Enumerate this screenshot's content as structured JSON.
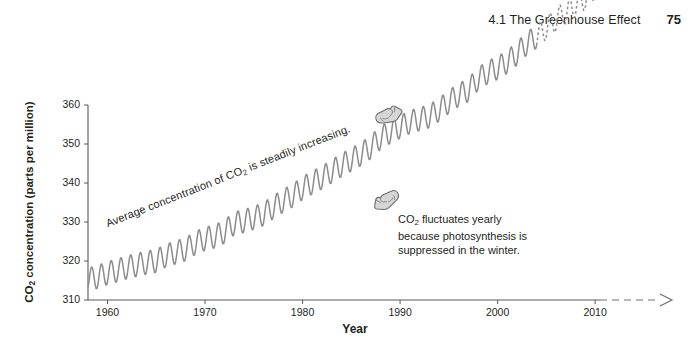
{
  "header": {
    "title": "4.1 The Greenhouse Effect",
    "page_number": "75"
  },
  "annotations": {
    "trend": "Average concentration of CO2 is steadily increasing.",
    "trend_prefix": "Average concentration of CO",
    "trend_sub": "2",
    "trend_suffix": " is steadily increasing.",
    "seasonal_line1_prefix": "CO",
    "seasonal_line1_sub": "2",
    "seasonal_line1_suffix": " fluctuates yearly",
    "seasonal_line2": "because photosynthesis is",
    "seasonal_line3": "suppressed in the winter.",
    "hand_trend_icon": "pointing-hand-right-icon",
    "hand_seasonal_icon": "pointing-hand-left-icon"
  },
  "chart_data": {
    "type": "line",
    "title": "",
    "xlabel": "Year",
    "ylabel_prefix": "CO",
    "ylabel_sub": "2",
    "ylabel_suffix": " concentration (parts per million)",
    "ylabel": "CO2 concentration (parts per million)",
    "xlim": [
      1958,
      2010.5
    ],
    "ylim": [
      310,
      363
    ],
    "xticks": [
      1960,
      1970,
      1980,
      1990,
      2000,
      2010
    ],
    "xticklabels": [
      "1960",
      "1970",
      "1980",
      "1990",
      "2000",
      "2010"
    ],
    "yticks": [
      310,
      320,
      330,
      340,
      350,
      360
    ],
    "yticklabels": [
      "310",
      "320",
      "330",
      "340",
      "350",
      "360"
    ],
    "grid": false,
    "legend": null,
    "line_color": "#8c8c8c",
    "series": [
      {
        "name": "Measured CO2 (Mauna Loa)",
        "style": "solid",
        "x_range": [
          1958,
          2004
        ],
        "annual_mean": [
          {
            "year": 1958,
            "value": 315.3
          },
          {
            "year": 1959,
            "value": 315.9
          },
          {
            "year": 1960,
            "value": 316.9
          },
          {
            "year": 1961,
            "value": 317.6
          },
          {
            "year": 1962,
            "value": 318.4
          },
          {
            "year": 1963,
            "value": 319.0
          },
          {
            "year": 1964,
            "value": 319.6
          },
          {
            "year": 1965,
            "value": 320.0
          },
          {
            "year": 1966,
            "value": 321.4
          },
          {
            "year": 1967,
            "value": 322.2
          },
          {
            "year": 1968,
            "value": 323.0
          },
          {
            "year": 1969,
            "value": 324.6
          },
          {
            "year": 1970,
            "value": 325.7
          },
          {
            "year": 1971,
            "value": 326.3
          },
          {
            "year": 1972,
            "value": 327.5
          },
          {
            "year": 1973,
            "value": 329.7
          },
          {
            "year": 1974,
            "value": 330.2
          },
          {
            "year": 1975,
            "value": 331.1
          },
          {
            "year": 1976,
            "value": 332.0
          },
          {
            "year": 1977,
            "value": 333.8
          },
          {
            "year": 1978,
            "value": 335.4
          },
          {
            "year": 1979,
            "value": 336.8
          },
          {
            "year": 1980,
            "value": 338.7
          },
          {
            "year": 1981,
            "value": 340.1
          },
          {
            "year": 1982,
            "value": 341.4
          },
          {
            "year": 1983,
            "value": 343.0
          },
          {
            "year": 1984,
            "value": 344.6
          },
          {
            "year": 1985,
            "value": 346.0
          },
          {
            "year": 1986,
            "value": 347.4
          },
          {
            "year": 1987,
            "value": 349.2
          },
          {
            "year": 1988,
            "value": 351.6
          },
          {
            "year": 1989,
            "value": 353.1
          },
          {
            "year": 1990,
            "value": 354.4
          },
          {
            "year": 1991,
            "value": 355.6
          },
          {
            "year": 1992,
            "value": 356.4
          },
          {
            "year": 1993,
            "value": 357.1
          },
          {
            "year": 1994,
            "value": 358.8
          },
          {
            "year": 1995,
            "value": 360.8
          },
          {
            "year": 1996,
            "value": 362.6
          },
          {
            "year": 1997,
            "value": 363.8
          },
          {
            "year": 1998,
            "value": 366.7
          },
          {
            "year": 1999,
            "value": 368.4
          },
          {
            "year": 2000,
            "value": 369.5
          },
          {
            "year": 2001,
            "value": 371.1
          },
          {
            "year": 2002,
            "value": 373.2
          },
          {
            "year": 2003,
            "value": 375.8
          },
          {
            "year": 2004,
            "value": 377.5
          }
        ],
        "seasonal_amplitude": 3.0
      },
      {
        "name": "Projected CO2",
        "style": "dashed",
        "x_range": [
          2004,
          2010
        ],
        "annual_mean": [
          {
            "year": 2005,
            "value": 379.8
          },
          {
            "year": 2006,
            "value": 381.9
          },
          {
            "year": 2007,
            "value": 383.8
          },
          {
            "year": 2008,
            "value": 385.6
          },
          {
            "year": 2009,
            "value": 387.4
          },
          {
            "year": 2010,
            "value": 389.8
          }
        ],
        "seasonal_amplitude": 3.0
      }
    ],
    "axis_extension": {
      "style": "dashed-arrow",
      "from_year": 2004,
      "to_year": 2010.6
    }
  }
}
